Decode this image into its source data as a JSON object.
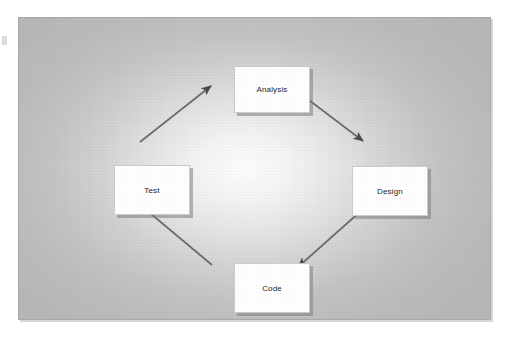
{
  "diagram": {
    "type": "cycle-diagram",
    "shape": "diamond",
    "direction": "clockwise",
    "panel": {
      "background_center_color": "#fdfdfd",
      "background_edge_color": "#b7b7b7",
      "border_color": "#a9a9a9"
    },
    "node_style": {
      "fill_color": "#ffffff",
      "border_color": "#cccccc",
      "shadow_color": "#7d7d7d",
      "text_color": "#1d1d1d"
    },
    "arrow_style": {
      "color": "#6b6b6b",
      "head_color": "#4a4a4a"
    },
    "nodes": [
      {
        "id": "analysis",
        "label": "Analysis",
        "position": "top"
      },
      {
        "id": "design",
        "label": "Design",
        "position": "right"
      },
      {
        "id": "code",
        "label": "Code",
        "position": "bottom"
      },
      {
        "id": "test",
        "label": "Test",
        "position": "left"
      }
    ],
    "edges": [
      {
        "from": "Analysis",
        "to": "Design",
        "direction": "down-right"
      },
      {
        "from": "Design",
        "to": "Code",
        "direction": "down-left"
      },
      {
        "from": "Code",
        "to": "Test",
        "direction": "up-left"
      },
      {
        "from": "Test",
        "to": "Analysis",
        "direction": "up-right"
      }
    ]
  }
}
